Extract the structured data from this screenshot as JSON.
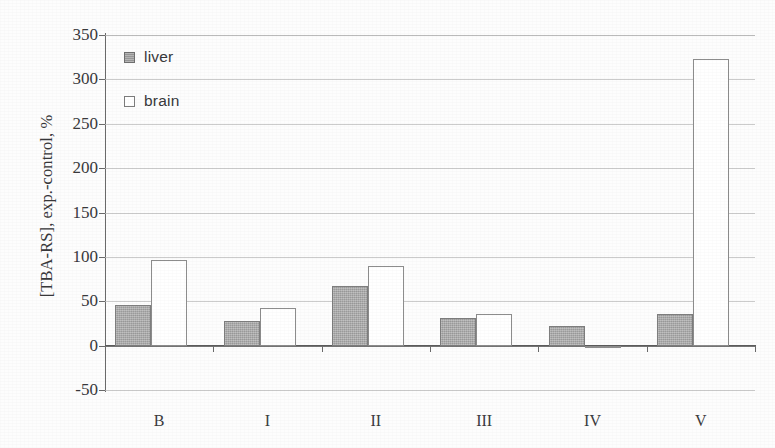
{
  "chart_data": {
    "type": "bar",
    "title": "",
    "xlabel": "",
    "ylabel": "[TBA-RS], exp.-control, %",
    "ylim": [
      -50,
      350
    ],
    "yticks": [
      350,
      300,
      250,
      200,
      150,
      100,
      50,
      0,
      -50
    ],
    "ytick_labels": [
      "350",
      "300",
      "250",
      "200",
      "150",
      "100",
      "50",
      "0",
      "-50"
    ],
    "grid": true,
    "legend_position": "top-left",
    "categories": [
      "B",
      "I",
      "II",
      "III",
      "IV",
      "V"
    ],
    "series": [
      {
        "name": "liver",
        "color": "#a9a9a9",
        "style": "filled-gray",
        "values": [
          46,
          28,
          67,
          31,
          22,
          36
        ]
      },
      {
        "name": "brain",
        "color": "#ffffff",
        "style": "outlined-white",
        "values": [
          96,
          42,
          90,
          36,
          -3,
          323
        ]
      }
    ]
  },
  "legend": {
    "items": [
      {
        "label": "liver",
        "swatch": "filled-gray-square"
      },
      {
        "label": "brain",
        "swatch": "outlined-white-square"
      }
    ]
  },
  "axes": {
    "y_title": "[TBA-RS], exp.-control, %"
  },
  "colors": {
    "liver_fill": "#a9a9a9",
    "liver_border": "#7e7e7e",
    "brain_fill": "#ffffff",
    "brain_border": "#8d8d8d",
    "gridline": "#b9b9b9",
    "axis": "#6a6a6a",
    "text": "#39393c",
    "background": "#fdfdfd"
  }
}
